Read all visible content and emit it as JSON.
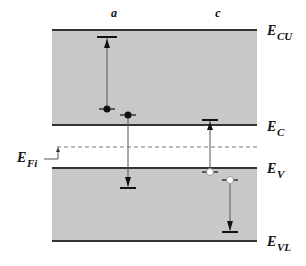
{
  "colors": {
    "band_fill": "#c8c8c8",
    "band_edge": "#333333",
    "line": "#444444",
    "dashed": "#777777",
    "electron": "#111111",
    "hole": "#ffffff"
  },
  "transition_labels": {
    "a": "a",
    "c": "c"
  },
  "energy_levels": {
    "ecu": {
      "main": "E",
      "sub": "CU"
    },
    "ec": {
      "main": "E",
      "sub": "C"
    },
    "efi": {
      "main": "E",
      "sub": "Fi"
    },
    "ev": {
      "main": "E",
      "sub": "V"
    },
    "evl": {
      "main": "E",
      "sub": "VL"
    }
  },
  "transitions": [
    {
      "id": "a-upper",
      "group": "a",
      "carrier": "electron",
      "direction": "up",
      "description": "electron excited from near E_C to upper level"
    },
    {
      "id": "a-lower",
      "group": "a",
      "carrier": "electron",
      "direction": "down",
      "description": "electron drops from conduction band into valence band"
    },
    {
      "id": "c-upper",
      "group": "c",
      "carrier": "hole",
      "direction": "up",
      "description": "hole transition from valence band edge up into conduction band edge"
    },
    {
      "id": "c-lower",
      "group": "c",
      "carrier": "hole",
      "direction": "down",
      "description": "hole relaxes deeper into valence band"
    }
  ]
}
